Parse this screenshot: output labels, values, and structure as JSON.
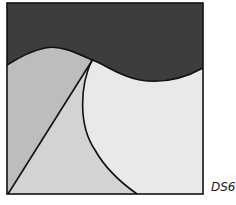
{
  "diagram": {
    "label": "DS6",
    "colors": {
      "top_region": "#3d3d3d",
      "left_region": "#bdbdbd",
      "middle_region": "#d3d3d3",
      "right_region": "#e9e9e9",
      "stroke": "#111111"
    },
    "regions": [
      "top-dark-wave",
      "left-mid-gray",
      "middle-triangle-light-gray",
      "right-circle-lightest"
    ]
  }
}
